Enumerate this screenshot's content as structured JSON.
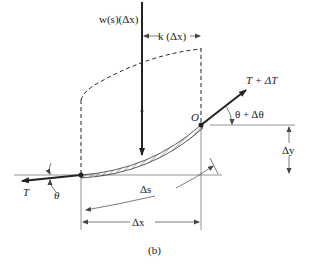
{
  "diagram": {
    "caption": "(b)",
    "labels": {
      "load": "w(s)(Δx)",
      "k": "k (Δx)",
      "tension_right": "T + ΔT",
      "angle_right": "θ + Δθ",
      "origin": "O",
      "delta_y": "Δy",
      "tension_left": "T",
      "angle_left": "θ",
      "delta_s": "Δs",
      "delta_x": "Δx"
    },
    "colors": {
      "ink": "#222222",
      "thin": "#555555",
      "background": "#ffffff"
    }
  }
}
